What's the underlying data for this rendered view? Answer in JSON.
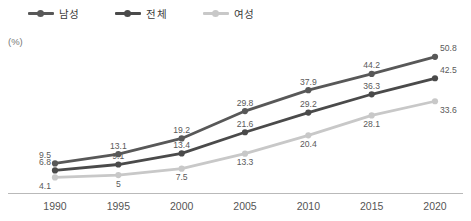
{
  "legend": {
    "position": "top-left",
    "items": [
      {
        "label": "남성",
        "color": "#585858",
        "key": "male"
      },
      {
        "label": "전체",
        "color": "#4a4a4a",
        "key": "total"
      },
      {
        "label": "여성",
        "color": "#c8c8c8",
        "key": "female"
      }
    ]
  },
  "axis": {
    "unit_label": "(%)"
  },
  "chart_data": {
    "type": "line",
    "title": "",
    "subtitle": "",
    "xlabel": "",
    "ylabel": "(%)",
    "grid": false,
    "legend_position": "top-left",
    "categories": [
      "1990",
      "1995",
      "2000",
      "2005",
      "2010",
      "2015",
      "2020"
    ],
    "x": [
      1990,
      1995,
      2000,
      2005,
      2010,
      2015,
      2020
    ],
    "ylim": [
      0,
      55
    ],
    "series": [
      {
        "name": "남성",
        "color": "#585858",
        "values": [
          9.5,
          13.1,
          19.2,
          29.8,
          37.9,
          44.2,
          50.8
        ],
        "labels": [
          "9.5",
          "13.1",
          "19.2",
          "29.8",
          "37.9",
          "44.2",
          "50.8"
        ]
      },
      {
        "name": "전체",
        "color": "#4a4a4a",
        "values": [
          6.8,
          9.1,
          13.4,
          21.6,
          29.2,
          36.3,
          42.5
        ],
        "labels": [
          "6.8",
          "9.1",
          "13.4",
          "21.6",
          "29.2",
          "36.3",
          "42.5"
        ]
      },
      {
        "name": "여성",
        "color": "#c8c8c8",
        "values": [
          4.1,
          5,
          7.5,
          13.3,
          20.4,
          28.1,
          33.6
        ],
        "labels": [
          "4.1",
          "5",
          "7.5",
          "13.3",
          "20.4",
          "28.1",
          "33.6"
        ]
      }
    ]
  }
}
